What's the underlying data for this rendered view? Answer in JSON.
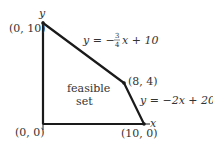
{
  "diagram": {
    "type": "feasible-region",
    "axes": {
      "x_label": "x",
      "y_label": "y"
    },
    "vertices": [
      {
        "label": "(0, 0)",
        "x": 0,
        "y": 0
      },
      {
        "label": "(0, 10)",
        "x": 0,
        "y": 10
      },
      {
        "label": "(8, 4)",
        "x": 8,
        "y": 4
      },
      {
        "label": "(10, 0)",
        "x": 10,
        "y": 0
      }
    ],
    "constraints": [
      {
        "label_prefix": "y = −",
        "frac_num": "3",
        "frac_den": "4",
        "label_suffix": "x + 10"
      },
      {
        "label": "y = −2x + 20"
      }
    ],
    "region_label_line1": "feasible",
    "region_label_line2": "set",
    "stroke_color": "#1a1a1a"
  }
}
